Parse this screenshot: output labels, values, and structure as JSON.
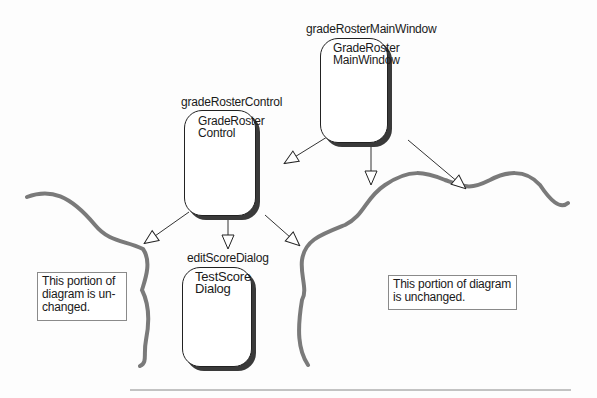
{
  "objects": [
    {
      "id": "main",
      "instance_label": "gradeRosterMainWindow",
      "class_line1": "GradeRoster",
      "class_line2": "MainWindow"
    },
    {
      "id": "control",
      "instance_label": "gradeRosterControl",
      "class_line1": "GradeRoster",
      "class_line2": "Control"
    },
    {
      "id": "dialog",
      "instance_label": "editScoreDialog",
      "class_line1": "TestScore",
      "class_line2": "Dialog"
    }
  ],
  "notes": {
    "left": {
      "line1": "This portion of",
      "line2": "diagram is un-",
      "line3": "changed."
    },
    "right": {
      "line1": "This portion of diagram",
      "line2": "is unchanged."
    }
  },
  "colors": {
    "boundary": "#7a7a7a",
    "box_border": "#222222",
    "box_shadow": "#3a3a3a",
    "note_border": "#8a8a8a",
    "rule": "#888888"
  }
}
